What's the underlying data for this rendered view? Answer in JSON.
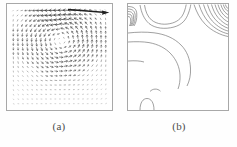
{
  "figure": {
    "background_color": "#fefefe",
    "frame_color": "#9a9a9a",
    "line_color": "#555555",
    "arrow_color": "#3a3a3a"
  },
  "panels": [
    {
      "id": "a",
      "caption": "(a)",
      "plot_type": "quiver",
      "description": "velocity vector field, lid-driven cavity flow"
    },
    {
      "id": "b",
      "caption": "(b)",
      "plot_type": "contour",
      "description": "contour lines"
    }
  ],
  "chart_data": [
    {
      "type": "scatter",
      "subtype": "quiver",
      "panel": "a",
      "title": "(a)",
      "xlabel": "",
      "ylabel": "",
      "xlim": [
        0,
        1
      ],
      "ylim": [
        0,
        1
      ],
      "grid": false,
      "legend": null,
      "annotations": [],
      "vortex_center": [
        0.53,
        0.65
      ],
      "lid_velocity": 1.0,
      "grid_nx": 21,
      "grid_ny": 21,
      "notes": "Primary recirculating vortex centred slightly right of midline and above centre; near-zero velocities in lower-left and lower-right corners; strong rightward jet along top lid."
    },
    {
      "type": "line",
      "subtype": "contour",
      "panel": "b",
      "title": "(b)",
      "xlabel": "",
      "ylabel": "",
      "xlim": [
        0,
        1
      ],
      "ylim": [
        0,
        1
      ],
      "grid": false,
      "legend": null,
      "annotations": [],
      "contour_levels": [
        -0.12,
        -0.09,
        -0.06,
        -0.04,
        -0.02,
        -0.01,
        0.0,
        0.01,
        0.02,
        0.04,
        0.06,
        0.09,
        0.12
      ],
      "notes": "Dense nested contours clustered in the upper-right corner and upper-left corner; one broad lobe sweeping through the mid-field; small arch-shaped closed contour near the bottom-left boundary."
    }
  ]
}
